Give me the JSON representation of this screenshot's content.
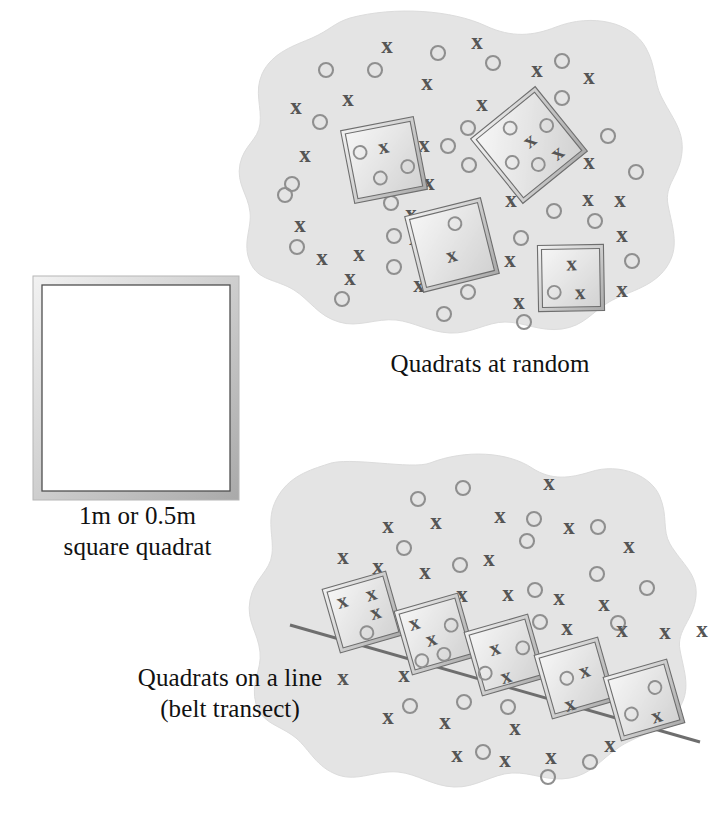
{
  "figure": {
    "title_alt": "Quadrat sampling methods diagram",
    "colors": {
      "blob_fill": "#e4e4e4",
      "blob_edge": "#dcdcdc",
      "x_mark": "#555555",
      "o_mark": "#8f8f8f",
      "frame_outer": "#cfcfcf",
      "frame_line": "#6e6e6e",
      "quadrat_fill": "#ffffff",
      "transect_line": "#6e6e6e",
      "text": "#111111",
      "page_background": "#ffffff"
    },
    "marker_labels": {
      "x": "x",
      "o": "o"
    }
  },
  "captions": {
    "square_quadrat": "1m or 0.5m\nsquare quadrat",
    "quadrats_at_random": "Quadrats at random",
    "quadrats_on_a_line": "Quadrats on a line\n(belt transect)"
  },
  "panels": {
    "square_quadrat": {
      "name": "square quadrat",
      "frame": {
        "x": 33,
        "y": 276,
        "width": 206,
        "height": 224
      }
    },
    "random": {
      "name": "Quadrats at random",
      "blob_path": "M 350 18 C 395 6 452 10 486 26 C 512 38 533 36 556 27 C 592 13 632 22 646 48 C 656 66 654 82 661 96 C 672 118 684 130 682 152 C 680 176 664 184 668 205 C 673 230 680 248 666 268 C 652 288 626 292 609 302 C 592 312 584 326 562 329 C 540 332 524 322 505 322 C 487 322 471 334 450 333 C 429 332 414 322 396 320 C 376 318 358 328 339 322 C 318 316 310 300 294 290 C 276 279 258 281 250 262 C 242 243 252 228 250 212 C 248 194 236 184 240 164 C 244 145 258 140 260 124 C 262 107 254 92 262 74 C 272 52 296 45 312 38 C 330 30 334 23 350 18 Z",
      "quadrats": [
        {
          "id": "q1",
          "cx": 384,
          "cy": 160,
          "size": 74,
          "rotate": -11,
          "markers": [
            {
              "type": "o",
              "dx": -22,
              "dy": -12
            },
            {
              "type": "x",
              "dx": 2,
              "dy": -13
            },
            {
              "type": "o",
              "dx": -7,
              "dy": 17
            },
            {
              "type": "o",
              "dx": 22,
              "dy": 11
            }
          ]
        },
        {
          "id": "q2",
          "cx": 529,
          "cy": 145,
          "size": 83,
          "rotate": -39,
          "markers": [
            {
              "type": "o",
              "dx": -4,
              "dy": -25
            },
            {
              "type": "x",
              "dx": 3,
              "dy": -3
            },
            {
              "type": "o",
              "dx": 26,
              "dy": -4
            },
            {
              "type": "o",
              "dx": -24,
              "dy": 3
            },
            {
              "type": "o",
              "dx": -5,
              "dy": 21
            },
            {
              "type": "x",
              "dx": 17,
              "dy": 24
            }
          ]
        },
        {
          "id": "q3",
          "cx": 452,
          "cy": 245,
          "size": 78,
          "rotate": -14,
          "markers": [
            {
              "type": "o",
              "dx": 8,
              "dy": -20
            },
            {
              "type": "x",
              "dx": -3,
              "dy": 10
            }
          ]
        },
        {
          "id": "q4",
          "cx": 571,
          "cy": 278,
          "size": 66,
          "rotate": -1,
          "markers": [
            {
              "type": "x",
              "dx": 1,
              "dy": -14
            },
            {
              "type": "o",
              "dx": -17,
              "dy": 14
            },
            {
              "type": "x",
              "dx": 9,
              "dy": 15
            }
          ]
        }
      ],
      "markers": [
        {
          "type": "x",
          "x": 387,
          "y": 46
        },
        {
          "type": "x",
          "x": 477,
          "y": 42
        },
        {
          "type": "o",
          "x": 438,
          "y": 53
        },
        {
          "type": "o",
          "x": 326,
          "y": 70
        },
        {
          "type": "o",
          "x": 375,
          "y": 70
        },
        {
          "type": "o",
          "x": 493,
          "y": 63
        },
        {
          "type": "o",
          "x": 562,
          "y": 61
        },
        {
          "type": "x",
          "x": 537,
          "y": 70
        },
        {
          "type": "x",
          "x": 589,
          "y": 77
        },
        {
          "type": "x",
          "x": 427,
          "y": 83
        },
        {
          "type": "x",
          "x": 348,
          "y": 99
        },
        {
          "type": "x",
          "x": 296,
          "y": 107
        },
        {
          "type": "x",
          "x": 482,
          "y": 104
        },
        {
          "type": "o",
          "x": 562,
          "y": 98
        },
        {
          "type": "o",
          "x": 320,
          "y": 122
        },
        {
          "type": "x",
          "x": 305,
          "y": 155
        },
        {
          "type": "o",
          "x": 468,
          "y": 128
        },
        {
          "type": "o",
          "x": 608,
          "y": 136
        },
        {
          "type": "o",
          "x": 292,
          "y": 184
        },
        {
          "type": "o",
          "x": 469,
          "y": 165
        },
        {
          "type": "x",
          "x": 424,
          "y": 145
        },
        {
          "type": "o",
          "x": 448,
          "y": 146
        },
        {
          "type": "x",
          "x": 429,
          "y": 183
        },
        {
          "type": "x",
          "x": 589,
          "y": 162
        },
        {
          "type": "o",
          "x": 636,
          "y": 172
        },
        {
          "type": "o",
          "x": 285,
          "y": 195
        },
        {
          "type": "x",
          "x": 300,
          "y": 225
        },
        {
          "type": "o",
          "x": 394,
          "y": 236
        },
        {
          "type": "o",
          "x": 391,
          "y": 203
        },
        {
          "type": "x",
          "x": 411,
          "y": 214
        },
        {
          "type": "x",
          "x": 511,
          "y": 200
        },
        {
          "type": "x",
          "x": 588,
          "y": 199
        },
        {
          "type": "o",
          "x": 595,
          "y": 221
        },
        {
          "type": "x",
          "x": 620,
          "y": 200
        },
        {
          "type": "o",
          "x": 297,
          "y": 247
        },
        {
          "type": "x",
          "x": 322,
          "y": 258
        },
        {
          "type": "x",
          "x": 359,
          "y": 254
        },
        {
          "type": "o",
          "x": 394,
          "y": 267
        },
        {
          "type": "x",
          "x": 350,
          "y": 278
        },
        {
          "type": "o",
          "x": 342,
          "y": 299
        },
        {
          "type": "x",
          "x": 419,
          "y": 285
        },
        {
          "type": "x",
          "x": 415,
          "y": 238
        },
        {
          "type": "x",
          "x": 510,
          "y": 260
        },
        {
          "type": "o",
          "x": 521,
          "y": 238
        },
        {
          "type": "o",
          "x": 554,
          "y": 211
        },
        {
          "type": "x",
          "x": 519,
          "y": 302
        },
        {
          "type": "o",
          "x": 468,
          "y": 292
        },
        {
          "type": "o",
          "x": 444,
          "y": 314
        },
        {
          "type": "x",
          "x": 622,
          "y": 235
        },
        {
          "type": "x",
          "x": 622,
          "y": 290
        },
        {
          "type": "o",
          "x": 632,
          "y": 261
        },
        {
          "type": "o",
          "x": 523,
          "y": 145
        },
        {
          "type": "o",
          "x": 524,
          "y": 322
        }
      ]
    },
    "belt": {
      "name": "Quadrats on a line (belt transect)",
      "blob_path": "M 430 463 C 466 449 508 452 532 468 C 552 481 570 478 590 472 C 620 462 652 476 660 497 C 668 516 662 530 670 544 C 682 564 698 574 696 596 C 694 620 676 630 680 650 C 684 672 692 690 678 710 C 662 732 634 736 618 748 C 600 760 592 774 570 778 C 548 782 532 772 512 773 C 492 774 476 788 454 787 C 432 786 418 774 398 772 C 376 770 358 782 338 775 C 316 767 310 750 296 738 C 280 725 262 724 256 704 C 250 683 262 670 260 652 C 258 632 246 622 250 600 C 254 578 270 572 272 554 C 274 536 266 520 276 500 C 288 476 310 470 328 464 C 348 456 412 470 430 463 Z",
      "transect": {
        "x1": 290,
        "y1": 625,
        "x2": 700,
        "y2": 742
      },
      "quadrats": [
        {
          "id": "b1",
          "cx": 363,
          "cy": 612,
          "size": 66,
          "rotate": -16,
          "markers": [
            {
              "type": "x",
              "dx": -17,
              "dy": -16
            },
            {
              "type": "x",
              "dx": 13,
              "dy": -15
            },
            {
              "type": "x",
              "dx": 12,
              "dy": 4
            },
            {
              "type": "o",
              "dx": -2,
              "dy": 21
            }
          ]
        },
        {
          "id": "b2",
          "cx": 435,
          "cy": 634,
          "size": 66,
          "rotate": -16,
          "markers": [
            {
              "type": "x",
              "dx": -17,
              "dy": -16
            },
            {
              "type": "x",
              "dx": -5,
              "dy": 4
            },
            {
              "type": "o",
              "dx": 18,
              "dy": -4
            },
            {
              "type": "o",
              "dx": 3,
              "dy": 22
            },
            {
              "type": "o",
              "dx": -20,
              "dy": 22
            }
          ]
        },
        {
          "id": "b3",
          "cx": 505,
          "cy": 655,
          "size": 66,
          "rotate": -16,
          "markers": [
            {
              "type": "x",
              "dx": -8,
              "dy": -9
            },
            {
              "type": "o",
              "dx": 19,
              "dy": -2
            },
            {
              "type": "x",
              "dx": -5,
              "dy": 21
            },
            {
              "type": "o",
              "dx": -24,
              "dy": 12
            }
          ]
        },
        {
          "id": "b4",
          "cx": 575,
          "cy": 678,
          "size": 66,
          "rotate": -16,
          "markers": [
            {
              "type": "o",
              "dx": -8,
              "dy": -2
            },
            {
              "type": "x",
              "dx": 11,
              "dy": -4
            },
            {
              "type": "x",
              "dx": -12,
              "dy": 24
            }
          ]
        },
        {
          "id": "b5",
          "cx": 644,
          "cy": 700,
          "size": 66,
          "rotate": -16,
          "markers": [
            {
              "type": "o",
              "dx": 14,
              "dy": -9
            },
            {
              "type": "o",
              "dx": -16,
              "dy": 10
            },
            {
              "type": "x",
              "dx": 8,
              "dy": 19
            }
          ]
        }
      ],
      "markers": [
        {
          "type": "x",
          "x": 549,
          "y": 483
        },
        {
          "type": "o",
          "x": 463,
          "y": 488
        },
        {
          "type": "o",
          "x": 418,
          "y": 499
        },
        {
          "type": "x",
          "x": 388,
          "y": 526
        },
        {
          "type": "x",
          "x": 436,
          "y": 522
        },
        {
          "type": "x",
          "x": 500,
          "y": 516
        },
        {
          "type": "o",
          "x": 534,
          "y": 519
        },
        {
          "type": "x",
          "x": 569,
          "y": 527
        },
        {
          "type": "o",
          "x": 598,
          "y": 527
        },
        {
          "type": "o",
          "x": 527,
          "y": 541
        },
        {
          "type": "x",
          "x": 629,
          "y": 546
        },
        {
          "type": "x",
          "x": 343,
          "y": 557
        },
        {
          "type": "o",
          "x": 404,
          "y": 548
        },
        {
          "type": "x",
          "x": 378,
          "y": 567
        },
        {
          "type": "x",
          "x": 425,
          "y": 572
        },
        {
          "type": "o",
          "x": 460,
          "y": 565
        },
        {
          "type": "x",
          "x": 489,
          "y": 559
        },
        {
          "type": "o",
          "x": 597,
          "y": 574
        },
        {
          "type": "o",
          "x": 647,
          "y": 588
        },
        {
          "type": "x",
          "x": 462,
          "y": 595
        },
        {
          "type": "x",
          "x": 508,
          "y": 594
        },
        {
          "type": "o",
          "x": 535,
          "y": 590
        },
        {
          "type": "x",
          "x": 559,
          "y": 598
        },
        {
          "type": "x",
          "x": 604,
          "y": 604
        },
        {
          "type": "o",
          "x": 540,
          "y": 622
        },
        {
          "type": "x",
          "x": 567,
          "y": 628
        },
        {
          "type": "o",
          "x": 618,
          "y": 623
        },
        {
          "type": "x",
          "x": 622,
          "y": 630
        },
        {
          "type": "x",
          "x": 665,
          "y": 632
        },
        {
          "type": "x",
          "x": 702,
          "y": 630
        },
        {
          "type": "x",
          "x": 343,
          "y": 678
        },
        {
          "type": "x",
          "x": 404,
          "y": 675
        },
        {
          "type": "o",
          "x": 410,
          "y": 706
        },
        {
          "type": "o",
          "x": 464,
          "y": 702
        },
        {
          "type": "x",
          "x": 388,
          "y": 717
        },
        {
          "type": "x",
          "x": 445,
          "y": 722
        },
        {
          "type": "o",
          "x": 508,
          "y": 707
        },
        {
          "type": "x",
          "x": 515,
          "y": 728
        },
        {
          "type": "x",
          "x": 457,
          "y": 755
        },
        {
          "type": "o",
          "x": 483,
          "y": 752
        },
        {
          "type": "x",
          "x": 505,
          "y": 760
        },
        {
          "type": "x",
          "x": 551,
          "y": 757
        },
        {
          "type": "o",
          "x": 590,
          "y": 762
        },
        {
          "type": "x",
          "x": 610,
          "y": 745
        },
        {
          "type": "o",
          "x": 548,
          "y": 777
        }
      ]
    }
  }
}
